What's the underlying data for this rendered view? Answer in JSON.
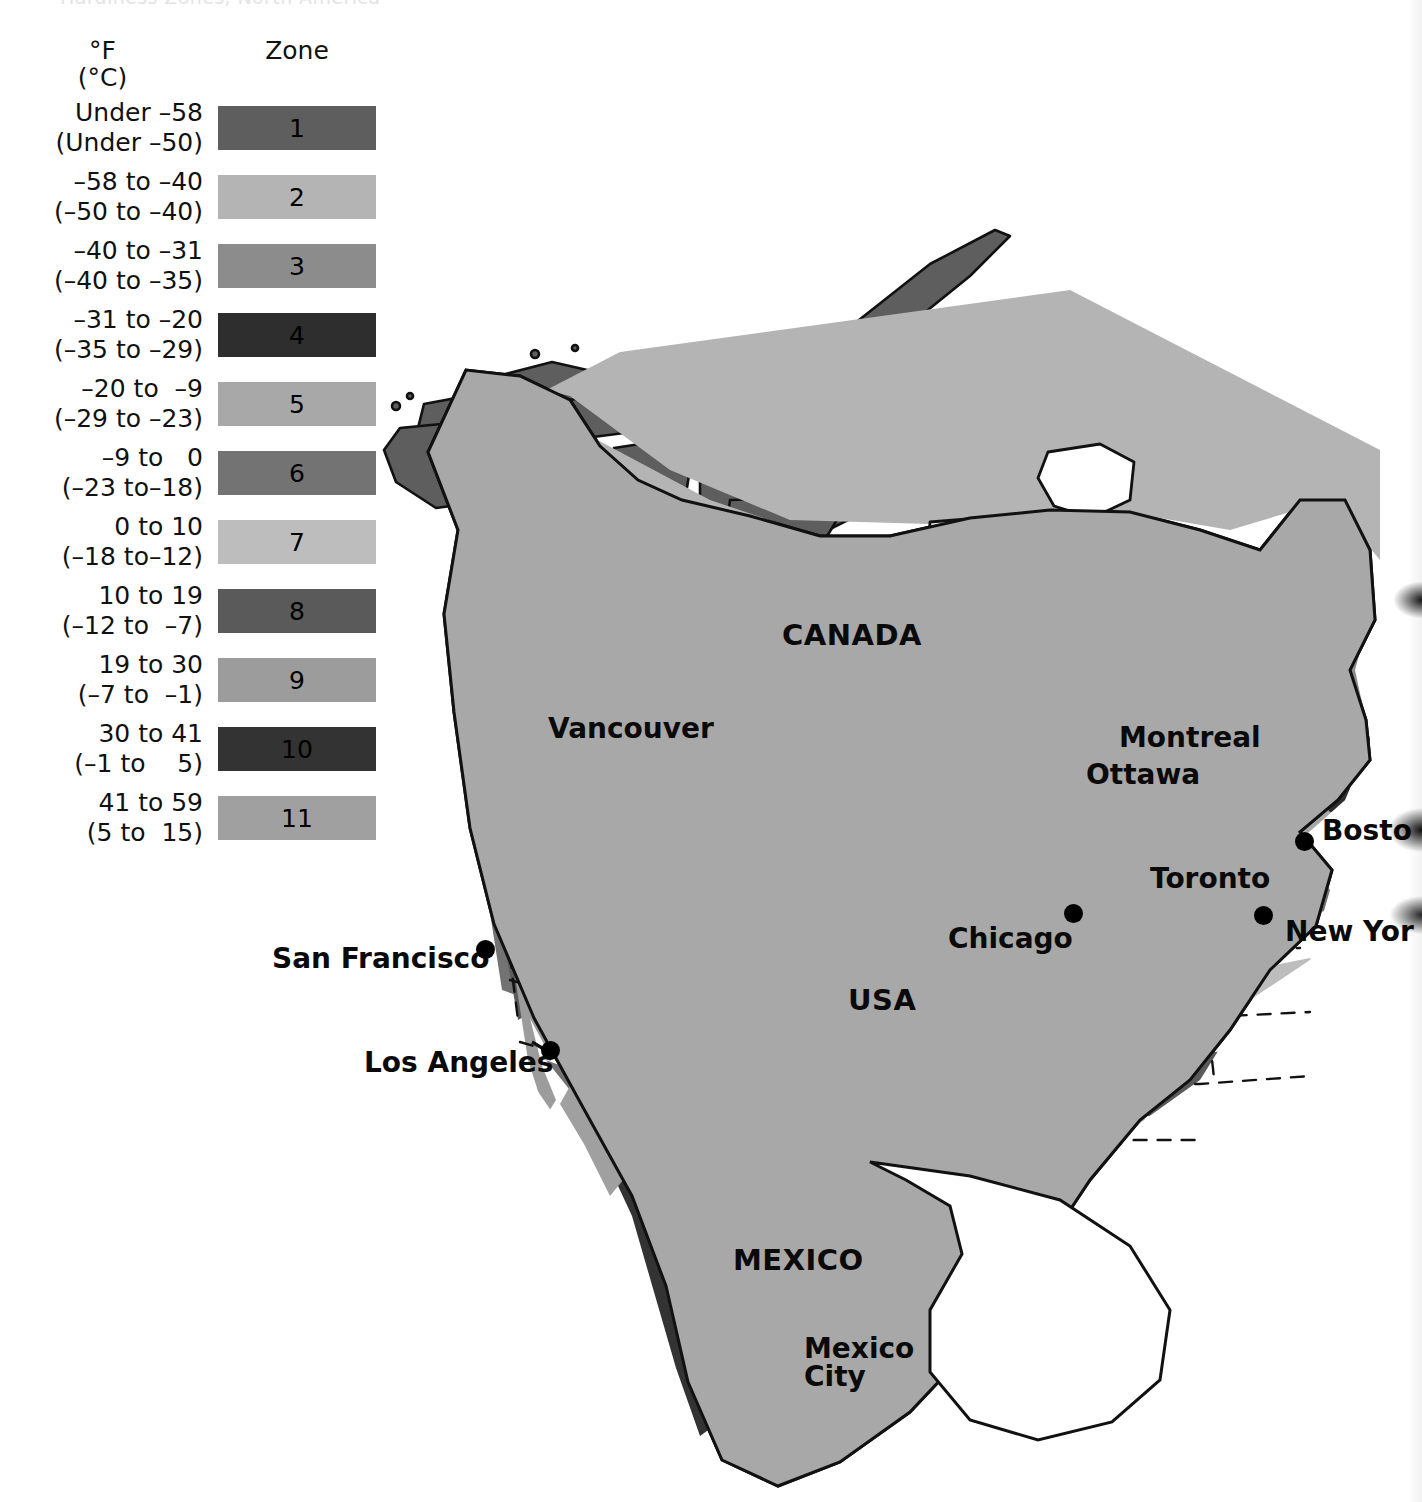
{
  "page": {
    "clipped_title_ghost": "Hardiness Zones, North America"
  },
  "legend": {
    "unit_f": "°F",
    "unit_c": "(°C)",
    "zone_header": "Zone",
    "rows": [
      {
        "zone": "1",
        "f": "Under –58",
        "c": "(Under –50)",
        "color": "#5e5e5e"
      },
      {
        "zone": "2",
        "f": "–58 to –40",
        "c": "(–50 to –40)",
        "color": "#b4b4b4"
      },
      {
        "zone": "3",
        "f": "–40 to –31",
        "c": "(–40 to –35)",
        "color": "#8c8c8c"
      },
      {
        "zone": "4",
        "f": "–31 to –20",
        "c": "(–35 to –29)",
        "color": "#2e2e2e"
      },
      {
        "zone": "5",
        "f": "–20 to  –9",
        "c": "(–29 to –23)",
        "color": "#a8a8a8"
      },
      {
        "zone": "6",
        "f": "–9 to   0",
        "c": "(–23 to–18)",
        "color": "#737373"
      },
      {
        "zone": "7",
        "f": "0 to 10",
        "c": "(–18 to–12)",
        "color": "#bdbdbd"
      },
      {
        "zone": "8",
        "f": "10 to 19",
        "c": "(–12 to  –7)",
        "color": "#5a5a5a"
      },
      {
        "zone": "9",
        "f": "19 to 30",
        "c": "(–7 to  –1)",
        "color": "#9c9c9c"
      },
      {
        "zone": "10",
        "f": "30 to 41",
        "c": "(–1 to    5)",
        "color": "#333333"
      },
      {
        "zone": "11",
        "f": "41 to 59",
        "c": "(5 to  15)",
        "color": "#a0a0a0"
      }
    ]
  },
  "map": {
    "countries": [
      {
        "name": "CANADA",
        "x": 412,
        "y": 420,
        "size": 29
      },
      {
        "name": "USA",
        "x": 478,
        "y": 785,
        "size": 29
      },
      {
        "name": "MEXICO",
        "x": 363,
        "y": 1045,
        "size": 29
      }
    ],
    "cities": [
      {
        "name": "Vancouver",
        "label_x": 178,
        "label_y": 514,
        "size": 28,
        "dot_x": null,
        "dot_y": null
      },
      {
        "name": "Montreal",
        "label_x": 749,
        "label_y": 523,
        "size": 28,
        "dot_x": null,
        "dot_y": null
      },
      {
        "name": "Ottawa",
        "label_x": 716,
        "label_y": 560,
        "size": 28,
        "dot_x": null,
        "dot_y": null
      },
      {
        "name": "Toronto",
        "label_x": 780,
        "label_y": 664,
        "size": 28,
        "dot_x": null,
        "dot_y": null
      },
      {
        "name": "Chicago",
        "label_x": 578,
        "label_y": 724,
        "size": 28,
        "dot_x": 694,
        "dot_y": 704
      },
      {
        "name": "Bosto",
        "label_x": 952,
        "label_y": 616,
        "size": 28,
        "dot_x": 925,
        "dot_y": 632
      },
      {
        "name": "New Yor",
        "label_x": 915,
        "label_y": 717,
        "size": 28,
        "dot_x": 884,
        "dot_y": 706
      },
      {
        "name": "San Francisco",
        "label_x": -98,
        "label_y": 744,
        "size": 28,
        "dot_x": 106,
        "dot_y": 740
      },
      {
        "name": "Los Angeles",
        "label_x": -6,
        "label_y": 848,
        "size": 28,
        "dot_x": 171,
        "dot_y": 841
      },
      {
        "name": "Mexico",
        "label_x": 434,
        "label_y": 1134,
        "size": 28,
        "dot_x": null,
        "dot_y": null
      },
      {
        "name": "City",
        "label_x": 434,
        "label_y": 1162,
        "size": 28,
        "dot_x": null,
        "dot_y": null
      }
    ],
    "colors": {
      "zone1": "#5e5e5e",
      "zone2": "#b4b4b4",
      "zone3": "#8c8c8c",
      "zone4": "#2e2e2e",
      "zone5": "#a8a8a8",
      "zone6": "#737373",
      "zone7": "#bdbdbd",
      "zone8": "#5a5a5a",
      "zone9": "#9c9c9c",
      "zone10": "#333333",
      "zone11": "#a0a0a0",
      "outline": "#111111",
      "water": "#ffffff"
    }
  }
}
